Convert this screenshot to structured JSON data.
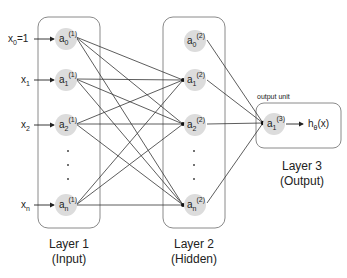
{
  "inputs": [
    {
      "label": "x",
      "sub": "0",
      "suffix": "=1"
    },
    {
      "label": "x",
      "sub": "1",
      "suffix": ""
    },
    {
      "label": "x",
      "sub": "2",
      "suffix": ""
    },
    {
      "label": "x",
      "sub": "n",
      "suffix": ""
    }
  ],
  "layer1": {
    "title": "Layer 1",
    "subtitle": "(Input)",
    "nodes": [
      {
        "base": "a",
        "sub": "0",
        "sup": "(1)"
      },
      {
        "base": "a",
        "sub": "1",
        "sup": "(1)"
      },
      {
        "base": "a",
        "sub": "2",
        "sup": "(1)"
      },
      {
        "base": "a",
        "sub": "n",
        "sup": "(1)"
      }
    ]
  },
  "layer2": {
    "title": "Layer 2",
    "subtitle": "(Hidden)",
    "nodes": [
      {
        "base": "a",
        "sub": "0",
        "sup": "(2)"
      },
      {
        "base": "a",
        "sub": "1",
        "sup": "(2)"
      },
      {
        "base": "a",
        "sub": "2",
        "sup": "(2)"
      },
      {
        "base": "a",
        "sub": "n",
        "sup": "(2)"
      }
    ]
  },
  "layer3": {
    "title": "Layer 3",
    "subtitle": "(Output)",
    "caption": "output unit",
    "node": {
      "base": "a",
      "sub": "1",
      "sup": "(3)"
    },
    "output": {
      "base": "h",
      "sub": "θ",
      "suffix": "(x)"
    }
  },
  "colors": {
    "node_fill": "#dcdcdc",
    "box_stroke": "#8a8a8a",
    "edge": "#333333"
  }
}
